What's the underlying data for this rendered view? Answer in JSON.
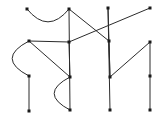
{
  "figure": {
    "width": 162,
    "height": 131,
    "background_color": "#ffffff",
    "node_color": "#1a1a1a",
    "edge_color": "#2b2b2b",
    "node_shape": "square-dot",
    "node_size_px": 3,
    "edge_width_px": 1
  },
  "chart_data": {
    "type": "scatter",
    "title": "",
    "xlabel": "",
    "ylabel": "",
    "grid": false,
    "legend": "none",
    "xlim": [
      0,
      162
    ],
    "ylim": [
      0,
      131
    ],
    "nodes": [
      {
        "id": "n1",
        "x": 27,
        "y": 9
      },
      {
        "id": "n2",
        "x": 69,
        "y": 9
      },
      {
        "id": "n3",
        "x": 108,
        "y": 8
      },
      {
        "id": "n4",
        "x": 150,
        "y": 8
      },
      {
        "id": "n5",
        "x": 29,
        "y": 41
      },
      {
        "id": "n6",
        "x": 69,
        "y": 42
      },
      {
        "id": "n7",
        "x": 109,
        "y": 41
      },
      {
        "id": "n8",
        "x": 150,
        "y": 42
      },
      {
        "id": "n9",
        "x": 29,
        "y": 76
      },
      {
        "id": "n10",
        "x": 70,
        "y": 77
      },
      {
        "id": "n11",
        "x": 110,
        "y": 77
      },
      {
        "id": "n12",
        "x": 150,
        "y": 76
      },
      {
        "id": "n13",
        "x": 29,
        "y": 111
      },
      {
        "id": "n14",
        "x": 70,
        "y": 110
      },
      {
        "id": "n15",
        "x": 110,
        "y": 110
      },
      {
        "id": "n16",
        "x": 150,
        "y": 110
      }
    ],
    "edges": [
      {
        "id": "e1",
        "from": "n1",
        "to": "n2",
        "kind": "arc",
        "bow": 13
      },
      {
        "id": "e2",
        "from": "n2",
        "to": "n14",
        "kind": "straight"
      },
      {
        "id": "e3",
        "from": "n3",
        "to": "n11",
        "kind": "straight"
      },
      {
        "id": "e4",
        "from": "n3",
        "to": "n15",
        "kind": "straight"
      },
      {
        "id": "e5",
        "from": "n4",
        "to": "n6",
        "kind": "straight"
      },
      {
        "id": "e6",
        "from": "n5",
        "to": "n6",
        "kind": "straight"
      },
      {
        "id": "e7",
        "from": "n5",
        "to": "n10",
        "kind": "straight"
      },
      {
        "id": "e8",
        "from": "n5",
        "to": "n9",
        "kind": "arc",
        "bow": 17
      },
      {
        "id": "e9",
        "from": "n6",
        "to": "n10",
        "kind": "straight"
      },
      {
        "id": "e10",
        "from": "n7",
        "to": "n11",
        "kind": "straight"
      },
      {
        "id": "e11",
        "from": "n7",
        "to": "n2",
        "kind": "straight"
      },
      {
        "id": "e12",
        "from": "n8",
        "to": "n12",
        "kind": "straight"
      },
      {
        "id": "e13",
        "from": "n8",
        "to": "n11",
        "kind": "straight"
      },
      {
        "id": "e14",
        "from": "n9",
        "to": "n13",
        "kind": "straight"
      },
      {
        "id": "e15",
        "from": "n10",
        "to": "n14",
        "kind": "arc",
        "bow": 16
      },
      {
        "id": "e16",
        "from": "n12",
        "to": "n16",
        "kind": "straight"
      }
    ]
  }
}
